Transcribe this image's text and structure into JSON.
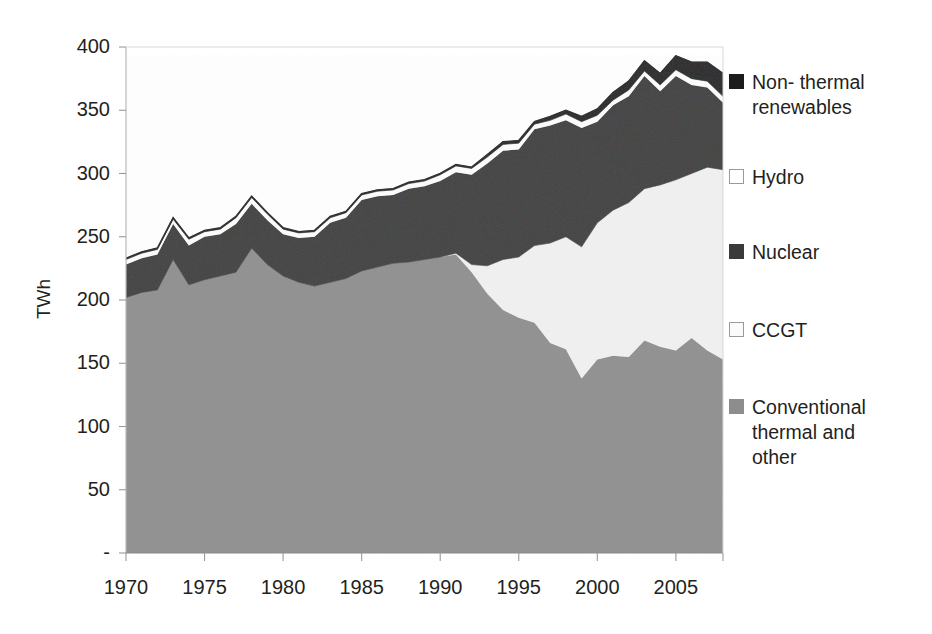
{
  "chart_data": {
    "type": "area",
    "stacked": true,
    "title": "",
    "subtitle": "",
    "xlabel": "",
    "ylabel": "TWh",
    "xlim": [
      1970,
      2008
    ],
    "ylim": [
      0,
      400
    ],
    "grid": false,
    "legend_position": "right",
    "y_ticks": [
      0,
      50,
      100,
      150,
      200,
      250,
      300,
      350,
      400
    ],
    "y_tick_labels": [
      "-",
      "50",
      "100",
      "150",
      "200",
      "250",
      "300",
      "350",
      "400"
    ],
    "x_ticks": [
      1970,
      1975,
      1980,
      1985,
      1990,
      1995,
      2000,
      2005
    ],
    "x_tick_labels": [
      "1970",
      "1975",
      "1980",
      "1985",
      "1990",
      "1995",
      "2000",
      "2005"
    ],
    "x": [
      1970,
      1971,
      1972,
      1973,
      1974,
      1975,
      1976,
      1977,
      1978,
      1979,
      1980,
      1981,
      1982,
      1983,
      1984,
      1985,
      1986,
      1987,
      1988,
      1989,
      1990,
      1991,
      1992,
      1993,
      1994,
      1995,
      1996,
      1997,
      1998,
      1999,
      2000,
      2001,
      2002,
      2003,
      2004,
      2005,
      2006,
      2007,
      2008
    ],
    "series": [
      {
        "name": "Conventional thermal and other",
        "color": "#8d8d8d",
        "stack_order": 1,
        "values": [
          202,
          206,
          208,
          232,
          212,
          216,
          219,
          222,
          241,
          228,
          219,
          214,
          211,
          214,
          217,
          223,
          226,
          229,
          230,
          232,
          234,
          236,
          222,
          205,
          192,
          186,
          182,
          166,
          161,
          138,
          153,
          156,
          155,
          168,
          163,
          160,
          170,
          160,
          153
        ]
      },
      {
        "name": "CCGT",
        "color": "#f0f0f0",
        "stack_order": 2,
        "values": [
          0,
          0,
          0,
          0,
          0,
          0,
          0,
          0,
          0,
          0,
          0,
          0,
          0,
          0,
          0,
          0,
          0,
          0,
          0,
          0,
          0,
          1,
          6,
          22,
          40,
          48,
          61,
          79,
          89,
          104,
          108,
          115,
          122,
          120,
          128,
          135,
          130,
          145,
          150
        ]
      },
      {
        "name": "Nuclear",
        "color": "#3a3a3a",
        "stack_order": 3,
        "values": [
          26,
          27,
          28,
          28,
          31,
          34,
          33,
          38,
          35,
          35,
          33,
          35,
          39,
          47,
          48,
          56,
          56,
          54,
          58,
          58,
          60,
          64,
          71,
          81,
          86,
          85,
          92,
          93,
          92,
          94,
          80,
          83,
          84,
          89,
          74,
          82,
          70,
          63,
          53
        ]
      },
      {
        "name": "Hydro",
        "color": "#fcfcfc",
        "stack_order": 4,
        "values": [
          4,
          4,
          4,
          4,
          5,
          4,
          4,
          5,
          5,
          5,
          4,
          4,
          4,
          4,
          4,
          4,
          4,
          4,
          4,
          4,
          5,
          5,
          5,
          5,
          5,
          5,
          4,
          4,
          5,
          5,
          5,
          4,
          5,
          4,
          5,
          5,
          5,
          5,
          5
        ]
      },
      {
        "name": "Non- thermal renewables",
        "color": "#1c1c1c",
        "stack_order": 5,
        "values": [
          1,
          1,
          1,
          1,
          1,
          1,
          1,
          1,
          1,
          1,
          1,
          1,
          1,
          1,
          1,
          1,
          1,
          1,
          1,
          1,
          1,
          1,
          1,
          2,
          2,
          2,
          2,
          3,
          3,
          4,
          5,
          6,
          7,
          8,
          9,
          11,
          13,
          15,
          18
        ]
      }
    ]
  },
  "axis": {
    "y_title": "TWh"
  },
  "legend": {
    "items": [
      {
        "label": "Non- thermal\nrenewables",
        "swatch": "#1c1c1c",
        "border": "#1c1c1c"
      },
      {
        "label": "Hydro",
        "swatch": "#ffffff",
        "border": "#9a9a9a"
      },
      {
        "label": "Nuclear",
        "swatch": "#3a3a3a",
        "border": "#3a3a3a"
      },
      {
        "label": "CCGT",
        "swatch": "#fafafa",
        "border": "#9a9a9a"
      },
      {
        "label": "Conventional\nthermal and\nother",
        "swatch": "#8d8d8d",
        "border": "#8d8d8d"
      }
    ]
  }
}
